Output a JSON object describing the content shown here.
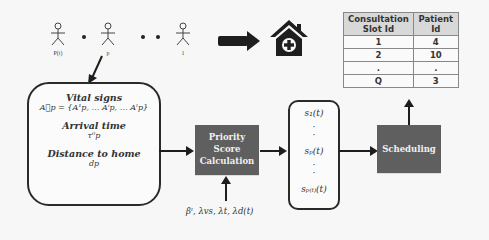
{
  "patients": {
    "labels": [
      "P(t)",
      "p",
      "1"
    ]
  },
  "input_box": {
    "vital_signs_title": "Vital signs",
    "vital_signs_formula": "A⃗p = {A¹p, … Aⁱp, … Aˡp}",
    "arrival_title": "Arrival time",
    "arrival_symbol": "τ⁰p",
    "distance_title": "Distance to home",
    "distance_symbol": "dp"
  },
  "priority_box": {
    "line1": "Priority",
    "line2": "Score",
    "line3": "Calculation"
  },
  "parameters": "βˡ, λvs, λt, λd(t)",
  "scores": {
    "s1": "s₁(t)",
    "sp": "sₚ(t)",
    "sP": "sₚ₍ₜ₎(t)"
  },
  "scheduling_box": {
    "label": "Scheduling"
  },
  "table": {
    "headers": [
      "Consultation Slot Id",
      "Patient Id"
    ],
    "header_lines": [
      [
        "Consultation",
        "Slot Id"
      ],
      [
        "Patient",
        "Id"
      ]
    ],
    "rows": [
      [
        "1",
        "4"
      ],
      [
        "2",
        "10"
      ],
      [
        ".",
        "."
      ],
      [
        "Q",
        "3"
      ]
    ]
  },
  "icons": {
    "hospital": "hospital-house-plus-icon",
    "patient": "stick-figure-icon"
  },
  "colors": {
    "dark_box": "#5f5f5f",
    "table_header": "#d8d8d8",
    "stroke": "#2a2a2a"
  }
}
